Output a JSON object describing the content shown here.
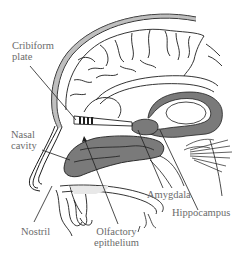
{
  "diagram": {
    "colors": {
      "line": "#1e1e1e",
      "fill_gray": "#7a7a7a",
      "label_text": "#6b6b6b",
      "background": "#ffffff"
    },
    "labels": {
      "cribiform_plate": {
        "line1": "Cribiform",
        "line2": "plate"
      },
      "nasal_cavity": {
        "line1": "Nasal",
        "line2": "cavity"
      },
      "nostril": {
        "line1": "Nostril"
      },
      "olfactory_epithelium": {
        "line1": "Olfactory",
        "line2": "epithelium"
      },
      "amygdala": {
        "line1": "Amygdala"
      },
      "hippocampus": {
        "line1": "Hippocampus"
      }
    }
  }
}
